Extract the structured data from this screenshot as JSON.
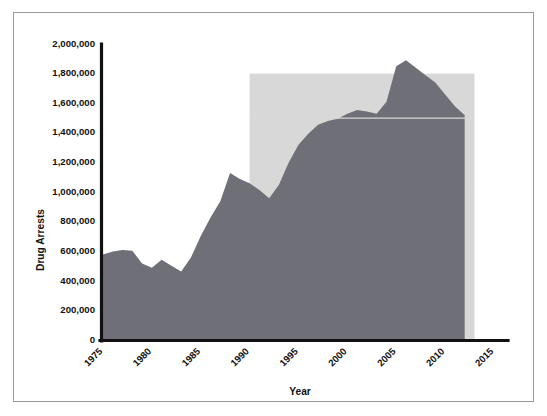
{
  "chart_data": {
    "type": "area",
    "title": "",
    "xlabel": "Year",
    "ylabel": "Drug Arrests",
    "xlim": [
      1975,
      2015
    ],
    "ylim": [
      0,
      2000000
    ],
    "grid": false,
    "legend": "none",
    "series_name": "Drug Arrests",
    "series_color": "#6f6f77",
    "x": [
      1975,
      1976,
      1977,
      1978,
      1979,
      1980,
      1981,
      1982,
      1983,
      1984,
      1985,
      1986,
      1987,
      1988,
      1989,
      1990,
      1991,
      1992,
      1993,
      1994,
      1995,
      1996,
      1997,
      1998,
      1999,
      2000,
      2001,
      2002,
      2003,
      2004,
      2005,
      2006,
      2007,
      2008,
      2009,
      2010,
      2011,
      2012
    ],
    "values": [
      580000,
      600000,
      610000,
      605000,
      520000,
      490000,
      545000,
      505000,
      465000,
      560000,
      705000,
      830000,
      940000,
      1130000,
      1090000,
      1060000,
      1015000,
      960000,
      1050000,
      1200000,
      1320000,
      1395000,
      1455000,
      1480000,
      1495000,
      1530000,
      1555000,
      1545000,
      1530000,
      1610000,
      1850000,
      1890000,
      1840000,
      1790000,
      1740000,
      1660000,
      1580000,
      1520000
    ],
    "reference_line": {
      "label": "",
      "y_value": 1500000,
      "x_start": 1990,
      "x_end": 2013,
      "color": "#d8d8d8"
    },
    "highlight_box": {
      "label": "",
      "x_start": 1990,
      "x_end": 2013,
      "y_bottom": 0,
      "y_top": 1800000,
      "color": "#c9c9c9"
    },
    "y_ticks": [
      0,
      200000,
      400000,
      600000,
      800000,
      1000000,
      1200000,
      1400000,
      1600000,
      1800000,
      2000000
    ],
    "y_tick_labels": [
      "0",
      "200,000",
      "400,000",
      "600,000",
      "800,000",
      "1,000,000",
      "1,200,000",
      "1,400,000",
      "1,600,000",
      "1,800,000",
      "2,000,000"
    ],
    "x_ticks": [
      1975,
      1980,
      1985,
      1990,
      1995,
      2000,
      2005,
      2010,
      2015
    ],
    "x_tick_labels": [
      "1975",
      "1980",
      "1985",
      "1990",
      "1995",
      "2000",
      "2005",
      "2010",
      "2015"
    ],
    "x_tick_rotation": -45
  }
}
